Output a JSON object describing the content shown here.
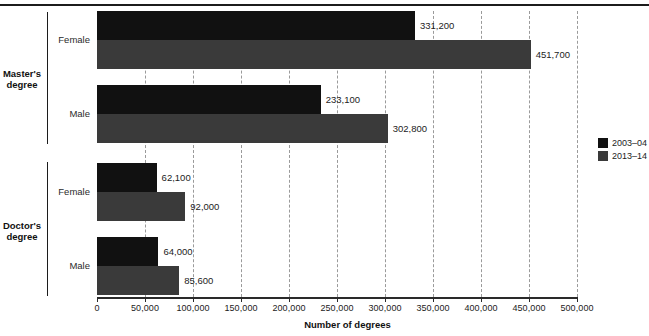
{
  "chart_data": {
    "type": "bar",
    "orientation": "horizontal",
    "title": "",
    "xlabel": "Number of degrees",
    "ylabel": "",
    "xlim": [
      0,
      500000
    ],
    "grid": true,
    "legend_position": "right",
    "xticks": [
      0,
      50000,
      100000,
      150000,
      200000,
      250000,
      300000,
      350000,
      400000,
      450000,
      500000
    ],
    "xtick_labels": [
      "0",
      "50,000",
      "100,000",
      "150,000",
      "200,000",
      "250,000",
      "300,000",
      "350,000",
      "400,000",
      "450,000",
      "500,000"
    ],
    "series": [
      {
        "name": "2003–04",
        "color": "#111111",
        "values": [
          331200,
          233100,
          62100,
          64000
        ]
      },
      {
        "name": "2013–14",
        "color": "#3a3a3a",
        "values": [
          451700,
          302800,
          92000,
          85600
        ]
      }
    ],
    "categories": [
      "Female",
      "Male",
      "Female",
      "Male"
    ],
    "category_groups": [
      {
        "label": "Master's degree",
        "label_line1": "Master's",
        "label_line2": "degree",
        "categories": [
          "Female",
          "Male"
        ]
      },
      {
        "label": "Doctor's degree",
        "label_line1": "Doctor's",
        "label_line2": "degree",
        "categories": [
          "Female",
          "Male"
        ]
      }
    ],
    "bars": [
      {
        "group": "Master's degree",
        "category": "Female",
        "series": "2003–04",
        "value": 331200,
        "label": "331,200"
      },
      {
        "group": "Master's degree",
        "category": "Female",
        "series": "2013–14",
        "value": 451700,
        "label": "451,700"
      },
      {
        "group": "Master's degree",
        "category": "Male",
        "series": "2003–04",
        "value": 233100,
        "label": "233,100"
      },
      {
        "group": "Master's degree",
        "category": "Male",
        "series": "2013–14",
        "value": 302800,
        "label": "302,800"
      },
      {
        "group": "Doctor's degree",
        "category": "Female",
        "series": "2003–04",
        "value": 62100,
        "label": "62,100"
      },
      {
        "group": "Doctor's degree",
        "category": "Female",
        "series": "2013–14",
        "value": 92000,
        "label": "92,000"
      },
      {
        "group": "Doctor's degree",
        "category": "Male",
        "series": "2003–04",
        "value": 64000,
        "label": "64,000"
      },
      {
        "group": "Doctor's degree",
        "category": "Male",
        "series": "2013–14",
        "value": 85600,
        "label": "85,600"
      }
    ]
  },
  "legend": {
    "items": [
      {
        "label": "2003–04",
        "color": "#111111"
      },
      {
        "label": "2013–14",
        "color": "#3a3a3a"
      }
    ]
  }
}
